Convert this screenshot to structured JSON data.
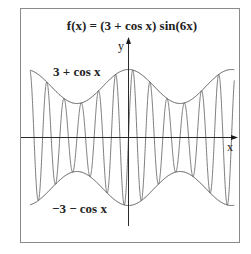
{
  "title": "f(x) = (3 + cos x) sin(6x)",
  "labels": {
    "upper_envelope": "3 + cos x",
    "lower_envelope": "−3 − cos x",
    "x_axis": "x",
    "y_axis": "y"
  },
  "colors": {
    "background": "#ffffff",
    "frame": "#8a8a8a",
    "axis": "#2a2a2a",
    "curve": "#6e6e6e",
    "envelope": "#4a4a4a"
  },
  "chart_data": {
    "type": "line",
    "title": "f(x) = (3 + cos x) sin(6x)",
    "xlabel": "x",
    "ylabel": "y",
    "xlim": [
      -6.0,
      6.45
    ],
    "ylim": [
      -4.5,
      4.5
    ],
    "grid": false,
    "series": [
      {
        "name": "f(x) = (3 + cos x) sin(6x)",
        "expression": "(3 + cos(x)) * sin(6x)"
      },
      {
        "name": "3 + cos x",
        "expression": "3 + cos(x)"
      },
      {
        "name": "−3 − cos x",
        "expression": "-3 - cos(x)"
      }
    ],
    "annotations": [
      "3 + cos x",
      "−3 − cos x"
    ]
  }
}
